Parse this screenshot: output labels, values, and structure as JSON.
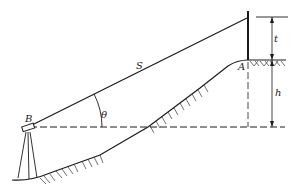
{
  "diagram": {
    "type": "trigonometric leveling / slope distance measurement",
    "labels": {
      "slope_distance": "S",
      "point_a": "A",
      "point_b": "B",
      "angle": "θ",
      "rod_height": "t",
      "height_difference": "h"
    },
    "elements": [
      {
        "name": "instrument",
        "description": "theodolite on tripod at point B"
      },
      {
        "name": "rod",
        "description": "vertical target rod at point A"
      },
      {
        "name": "sight-line",
        "description": "slope line S from instrument B to top of rod"
      },
      {
        "name": "horizontal-line",
        "description": "dashed horizontal line through instrument B"
      },
      {
        "name": "vertical-angle",
        "description": "angle θ between sight line and horizontal"
      },
      {
        "name": "dimension-t",
        "description": "rod height t from rod top to ground at A"
      },
      {
        "name": "dimension-h",
        "description": "height h from ground at A down to the horizontal through B"
      },
      {
        "name": "terrain",
        "description": "sloping ground profile with hatching"
      }
    ]
  }
}
